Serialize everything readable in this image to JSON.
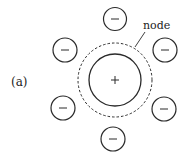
{
  "figure": {
    "panel_label": "(a)",
    "node_label": "node",
    "center_sign": "+",
    "ion_sign": "−",
    "colors": {
      "stroke": "#2a2a2a",
      "background": "#ffffff"
    }
  },
  "diagram": {
    "central_charge": {
      "sign": "+",
      "cx": 115,
      "cy": 80,
      "r": 26
    },
    "node_boundary": {
      "style": "dashed",
      "cx": 115,
      "cy": 80,
      "r": 37
    },
    "surrounding_charges": [
      {
        "sign": "−",
        "cx": 115,
        "cy": 19,
        "r": 11
      },
      {
        "sign": "−",
        "cx": 65,
        "cy": 50,
        "r": 12
      },
      {
        "sign": "−",
        "cx": 165,
        "cy": 50,
        "r": 12
      },
      {
        "sign": "−",
        "cx": 63,
        "cy": 108,
        "r": 12
      },
      {
        "sign": "−",
        "cx": 164,
        "cy": 109,
        "r": 12
      },
      {
        "sign": "−",
        "cx": 113,
        "cy": 139,
        "r": 12
      }
    ]
  }
}
